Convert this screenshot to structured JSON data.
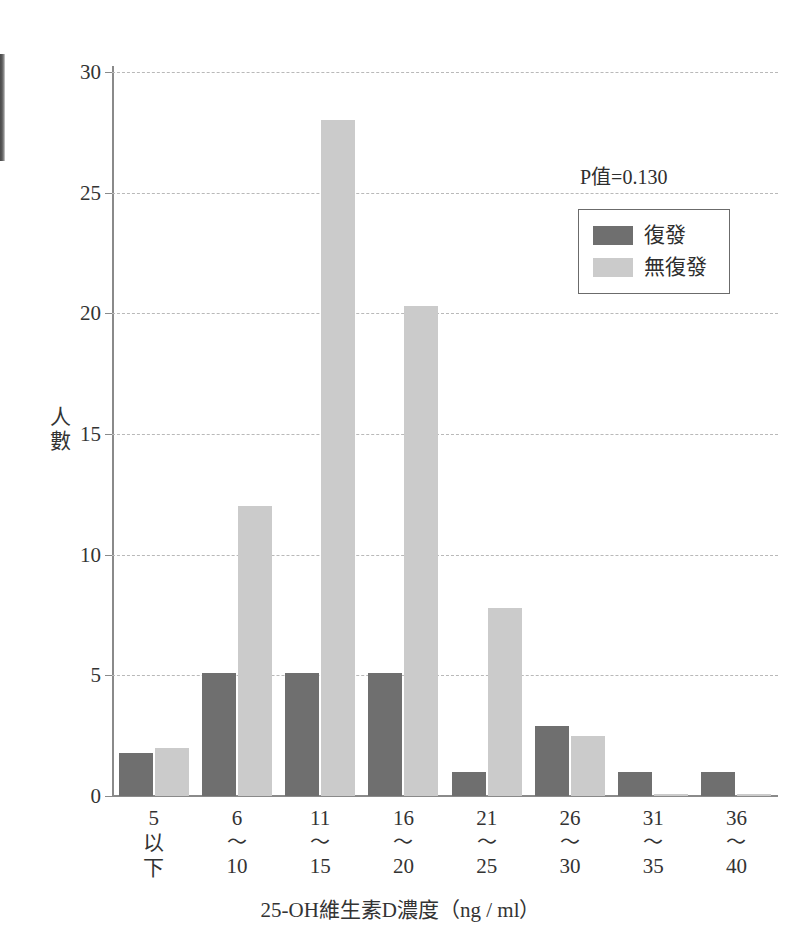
{
  "chart_data": {
    "type": "bar",
    "title": "",
    "xlabel": "25-OH維生素D濃度（ng / ml）",
    "ylabel": "人數",
    "ylim": [
      0,
      30
    ],
    "yticks": [
      0,
      5,
      10,
      15,
      20,
      25,
      30
    ],
    "grid": true,
    "legend_position": "top-right",
    "annotation": "P值=0.130",
    "categories": [
      [
        "5",
        "以",
        "下"
      ],
      [
        "6",
        "〜",
        "10"
      ],
      [
        "11",
        "〜",
        "15"
      ],
      [
        "16",
        "〜",
        "20"
      ],
      [
        "21",
        "〜",
        "25"
      ],
      [
        "26",
        "〜",
        "30"
      ],
      [
        "31",
        "〜",
        "35"
      ],
      [
        "36",
        "〜",
        "40"
      ]
    ],
    "series": [
      {
        "name": "復發",
        "color": "#6f6f6f",
        "values": [
          1.8,
          5.1,
          5.1,
          5.1,
          1.0,
          2.9,
          1.0,
          1.0
        ]
      },
      {
        "name": "無復發",
        "color": "#cbcbcb",
        "values": [
          2.0,
          12.0,
          28.0,
          20.3,
          7.8,
          2.5,
          0.1,
          0.1
        ]
      }
    ]
  },
  "colors": {
    "series_recurrence": "#6f6f6f",
    "series_no_recurrence": "#cbcbcb",
    "axis": "#8a8a8a",
    "grid": "#b9b9b9",
    "text": "#2e2e2e"
  }
}
